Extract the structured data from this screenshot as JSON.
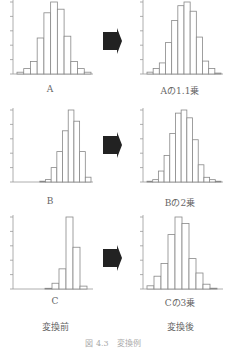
{
  "labels": {
    "A": "A",
    "A_after": "Aの1.1乗",
    "B": "B",
    "B_after": "Bの2乗",
    "C": "C",
    "C_after": "Cの3乗",
    "before": "変換前",
    "after": "変換後",
    "figure_caption": "図 4.3　変換例"
  },
  "chart_data": [
    {
      "type": "bar",
      "title": "A",
      "values": [
        1,
        3,
        7,
        20,
        34,
        40,
        36,
        21,
        7,
        3,
        1
      ]
    },
    {
      "type": "bar",
      "title": "Aの1.1乗",
      "values": [
        1,
        3,
        6,
        17,
        29,
        37,
        39,
        34,
        20,
        7,
        3,
        0.5
      ]
    },
    {
      "type": "bar",
      "title": "B",
      "values": [
        0,
        0,
        0,
        0,
        0.5,
        1.5,
        9,
        19,
        32,
        45,
        38,
        19,
        3
      ]
    },
    {
      "type": "bar",
      "title": "Bの2乗",
      "values": [
        0.5,
        1.5,
        7,
        17,
        31,
        44,
        46,
        41,
        27,
        11,
        3,
        1.5,
        0.5
      ]
    },
    {
      "type": "bar",
      "title": "C",
      "values": [
        0,
        0,
        0,
        0,
        0.5,
        4,
        14,
        50,
        29,
        2
      ]
    },
    {
      "type": "bar",
      "title": "Cの3乗",
      "values": [
        2,
        8,
        16,
        34,
        45,
        41,
        19,
        10,
        3,
        0.5
      ]
    }
  ]
}
